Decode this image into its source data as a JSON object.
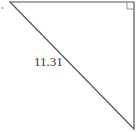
{
  "diagram": {
    "type": "right-triangle",
    "vertices": {
      "top_left": [
        10,
        2
      ],
      "right_angle": [
        134,
        2
      ],
      "bottom_right": [
        134,
        129
      ]
    },
    "hypotenuse_label": "11.31",
    "right_angle_marker": true,
    "colors": {
      "stroke": "#555555",
      "marker": "#888888",
      "text": "#333333",
      "background": "#ffffff"
    }
  }
}
